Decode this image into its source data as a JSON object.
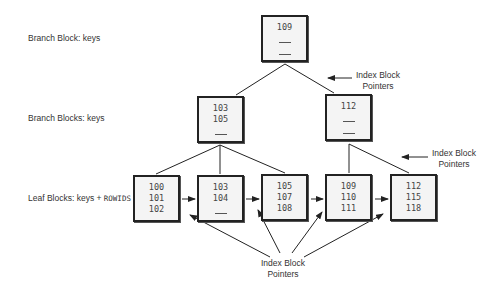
{
  "labels": {
    "root": "Branch Block: keys",
    "branch": "Branch Blocks: keys",
    "leaf_prefix": "Leaf Blocks: keys + ",
    "leaf_mono": "ROWIDS"
  },
  "pointer_labels": [
    {
      "line1": "Index Block",
      "line2": "Pointers"
    },
    {
      "line1": "Index Block",
      "line2": "Pointers"
    },
    {
      "line1": "Index Block",
      "line2": "Pointers"
    }
  ],
  "root_block": {
    "keys": [
      "109"
    ],
    "blanks": 2
  },
  "branch_blocks": [
    {
      "keys": [
        "103",
        "105"
      ],
      "blanks": 1
    },
    {
      "keys": [
        "112"
      ],
      "blanks": 2
    }
  ],
  "leaf_blocks": [
    {
      "keys": [
        "100",
        "101",
        "102"
      ]
    },
    {
      "keys": [
        "103",
        "104"
      ],
      "blanks": 1
    },
    {
      "keys": [
        "105",
        "107",
        "108"
      ]
    },
    {
      "keys": [
        "109",
        "110",
        "111"
      ]
    },
    {
      "keys": [
        "112",
        "115",
        "118"
      ]
    }
  ]
}
